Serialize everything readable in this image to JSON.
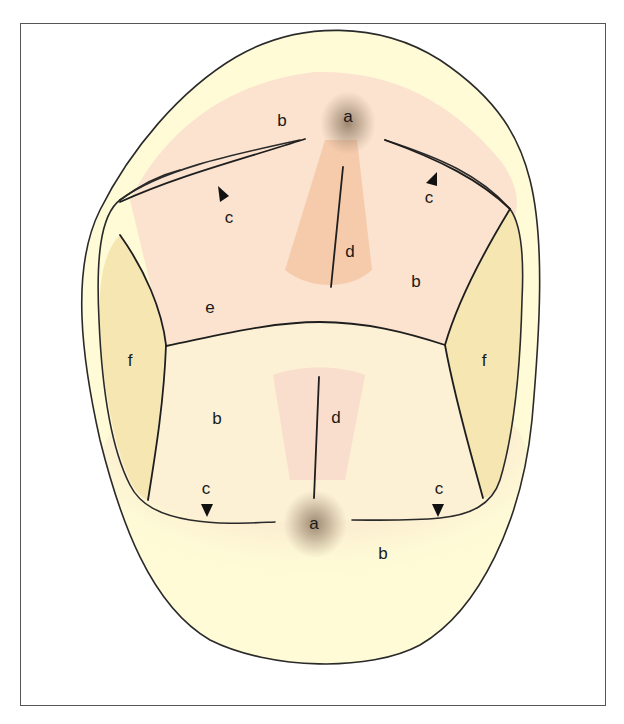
{
  "figure": {
    "labels": {
      "fossa_top": "a",
      "fossa_bottom": "a",
      "cusp_area_top_left": "b",
      "cusp_area_mid_right": "b",
      "cusp_area_lower_left": "b",
      "cusp_area_bottom": "b",
      "arrow_top_left": "c",
      "arrow_top_right": "c",
      "arrow_bottom_left": "c",
      "arrow_bottom_right": "c",
      "ridge_top": "d",
      "ridge_bottom": "d",
      "transverse_region": "e",
      "marginal_ridge_left": "f",
      "marginal_ridge_right": "f"
    },
    "colors": {
      "crown_outer": "#fefbd6",
      "cusp_region_upper": "#fbe3cf",
      "occlusal_lower": "#fcf0d5",
      "marginal_ridge": "#f6e6b2",
      "ridge_upper": "#f4c7a6",
      "ridge_lower": "#f8dacb",
      "fossa_shadow": "#7a6650",
      "outline": "#2a2a2a"
    }
  }
}
